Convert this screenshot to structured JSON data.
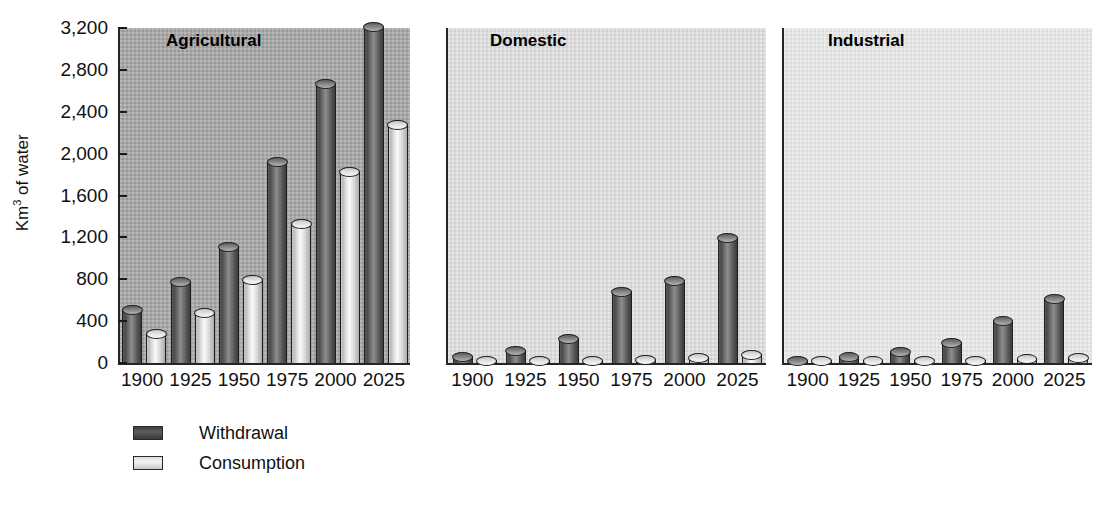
{
  "chart_data": {
    "type": "bar",
    "title": "",
    "xlabel": "",
    "ylabel": "Km3 of water",
    "ylabel_prefix": "Km",
    "ylabel_sup": "3",
    "ylabel_suffix": " of water",
    "ylim": [
      0,
      3200
    ],
    "yticks": [
      "0",
      "400",
      "800",
      "1,200",
      "1,600",
      "2,000",
      "2,400",
      "2,800",
      "3,200"
    ],
    "ytick_values": [
      0,
      400,
      800,
      1200,
      1600,
      2000,
      2400,
      2800,
      3200
    ],
    "grid": false,
    "legend_position": "below-left",
    "categories": [
      "1900",
      "1925",
      "1950",
      "1975",
      "2000",
      "2025"
    ],
    "legend": [
      {
        "name": "Withdrawal",
        "color": "#4a4a4a"
      },
      {
        "name": "Consumption",
        "color": "#dcdcdc"
      }
    ],
    "panels": [
      {
        "title": "Agricultural",
        "bg_color": "#a8a8a8",
        "series": [
          {
            "name": "Withdrawal",
            "values": [
              520,
              780,
              1120,
              1930,
              2670,
              3220
            ]
          },
          {
            "name": "Consumption",
            "values": [
              290,
              490,
              800,
              1340,
              1830,
              2280
            ]
          }
        ]
      },
      {
        "title": "Domestic",
        "bg_color": "#dcdcdc",
        "series": [
          {
            "name": "Withdrawal",
            "values": [
              70,
              120,
              240,
              690,
              790,
              1200
            ]
          },
          {
            "name": "Consumption",
            "values": [
              15,
              20,
              30,
              40,
              60,
              90
            ]
          }
        ]
      },
      {
        "title": "Industrial",
        "bg_color": "#e6e6e6",
        "series": [
          {
            "name": "Withdrawal",
            "values": [
              30,
              70,
              110,
              200,
              410,
              620
            ]
          },
          {
            "name": "Consumption",
            "values": [
              10,
              15,
              20,
              25,
              45,
              60
            ]
          }
        ]
      }
    ]
  },
  "axis": {
    "y_label_text": "Km3 of water"
  },
  "legend": {
    "withdrawal_label": "Withdrawal",
    "consumption_label": "Consumption"
  }
}
